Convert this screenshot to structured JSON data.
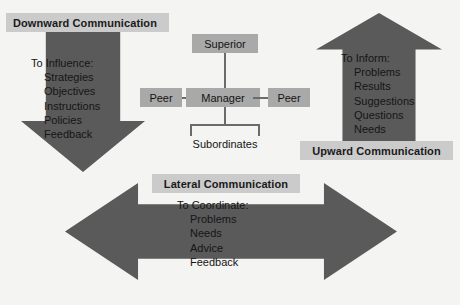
{
  "diagram": {
    "background_color": "#f4f4f2",
    "arrow_color": "#5a5a5a",
    "band_color": "#cbcbcb",
    "node_color": "#a9a9a9"
  },
  "downward": {
    "band_label": "Downward Communication",
    "heading": "To Influence:",
    "items": [
      "Strategies",
      "Objectives",
      "Instructions",
      "Policies",
      "Feedback"
    ]
  },
  "upward": {
    "band_label": "Upward Communication",
    "heading": "To Inform:",
    "items": [
      "Problems",
      "Results",
      "Suggestions",
      "Questions",
      "Needs"
    ]
  },
  "lateral": {
    "band_label": "Lateral Communication",
    "heading": "To Coordinate:",
    "items": [
      "Problems",
      "Needs",
      "Advice",
      "Feedback"
    ]
  },
  "org_chart": {
    "superior": "Superior",
    "manager": "Manager",
    "peer_left": "Peer",
    "peer_right": "Peer",
    "subordinates": "Subordinates"
  }
}
